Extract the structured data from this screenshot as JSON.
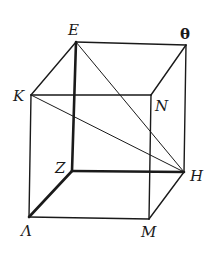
{
  "figure": {
    "type": "cube",
    "vertices": [
      {
        "id": "E",
        "label": "E"
      },
      {
        "id": "TH",
        "label": "θ"
      },
      {
        "id": "K",
        "label": "K"
      },
      {
        "id": "N",
        "label": "N"
      },
      {
        "id": "Z",
        "label": "Z"
      },
      {
        "id": "H",
        "label": "H"
      },
      {
        "id": "L",
        "label": "Λ"
      },
      {
        "id": "M",
        "label": "M"
      }
    ],
    "edges": [
      {
        "from": "E",
        "to": "TH",
        "weight": "normal"
      },
      {
        "from": "E",
        "to": "K",
        "weight": "normal"
      },
      {
        "from": "TH",
        "to": "N",
        "weight": "normal"
      },
      {
        "from": "K",
        "to": "N",
        "weight": "normal"
      },
      {
        "from": "E",
        "to": "Z",
        "weight": "bold"
      },
      {
        "from": "TH",
        "to": "H",
        "weight": "normal"
      },
      {
        "from": "K",
        "to": "L",
        "weight": "normal"
      },
      {
        "from": "N",
        "to": "M",
        "weight": "normal"
      },
      {
        "from": "Z",
        "to": "H",
        "weight": "bold"
      },
      {
        "from": "Z",
        "to": "L",
        "weight": "bold"
      },
      {
        "from": "L",
        "to": "M",
        "weight": "normal"
      },
      {
        "from": "M",
        "to": "H",
        "weight": "normal"
      }
    ],
    "diagonals": [
      {
        "from": "E",
        "to": "H"
      },
      {
        "from": "K",
        "to": "H"
      }
    ],
    "line_color": "#1a1a1a"
  }
}
